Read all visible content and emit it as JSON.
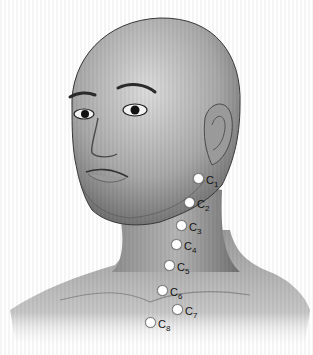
{
  "figure": {
    "colors": {
      "background": "#ffffff",
      "skin_light": "#d6d6d6",
      "skin_mid": "#a8a8a8",
      "skin_dark": "#5e5e5e",
      "outline": "#3a3a3a",
      "marker_fill": "#ffffff",
      "label_text": "#111111"
    }
  },
  "markers": [
    {
      "letter": "C",
      "num": "1",
      "x": 198,
      "y": 178,
      "lx": 206,
      "ly": 175
    },
    {
      "letter": "C",
      "num": "2",
      "x": 189,
      "y": 202,
      "lx": 197,
      "ly": 199
    },
    {
      "letter": "C",
      "num": "3",
      "x": 181,
      "y": 225,
      "lx": 189,
      "ly": 222
    },
    {
      "letter": "C",
      "num": "4",
      "x": 176,
      "y": 244,
      "lx": 184,
      "ly": 241
    },
    {
      "letter": "C",
      "num": "5",
      "x": 169,
      "y": 265,
      "lx": 177,
      "ly": 262
    },
    {
      "letter": "C",
      "num": "6",
      "x": 162,
      "y": 290,
      "lx": 170,
      "ly": 287
    },
    {
      "letter": "C",
      "num": "7",
      "x": 177,
      "y": 309,
      "lx": 185,
      "ly": 306
    },
    {
      "letter": "C",
      "num": "8",
      "x": 150,
      "y": 322,
      "lx": 158,
      "ly": 319
    }
  ]
}
